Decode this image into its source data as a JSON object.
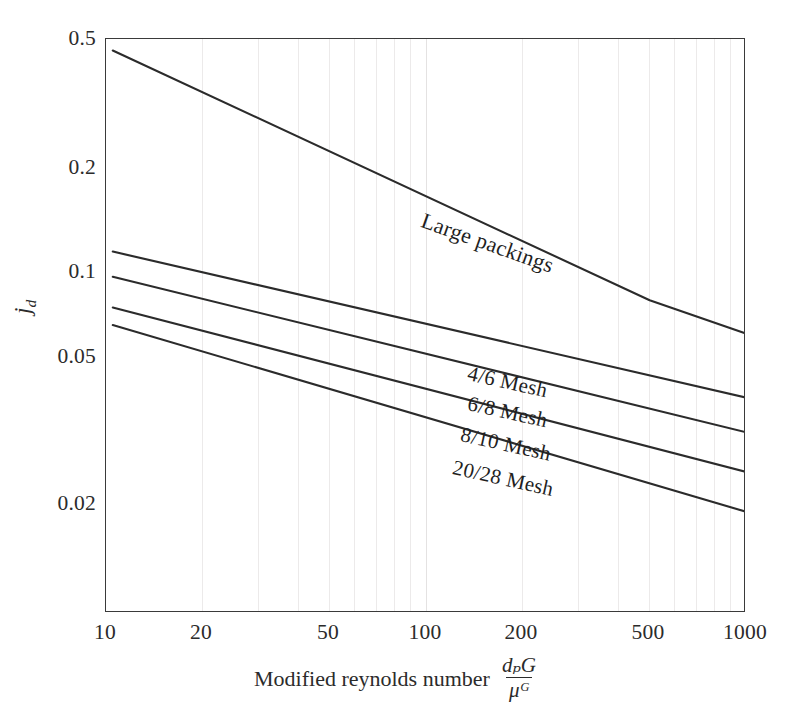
{
  "chart_data": {
    "type": "line",
    "title": "",
    "xlabel": "Modified reynolds number d_p G / μ_G",
    "xlabel_text": "Modified reynolds number",
    "xlabel_fraction": {
      "numerator": "dₚG",
      "denominator": "μᴳ"
    },
    "ylabel": "j_d",
    "ylabel_base": "j",
    "ylabel_sub": "d",
    "xscale": "log",
    "yscale": "log",
    "xlim": [
      10,
      1000
    ],
    "ylim": [
      0.015,
      0.5
    ],
    "xticks": [
      10,
      20,
      50,
      100,
      200,
      500,
      1000
    ],
    "xtick_labels": [
      "10",
      "20",
      "50",
      "100",
      "200",
      "500",
      "1000"
    ],
    "yticks": [
      0.5,
      0.2,
      0.1,
      0.05,
      0.02
    ],
    "ytick_labels": [
      "0.5",
      "0.2",
      "0.1",
      "0.05",
      "0.02"
    ],
    "grid": "vertical-minor-only",
    "legend": "inline-curve-labels",
    "series": [
      {
        "name": "Large packings",
        "label": "Large packings",
        "points": [
          [
            10.5,
            0.462
          ],
          [
            500,
            0.083
          ],
          [
            1000,
            0.066
          ]
        ]
      },
      {
        "name": "4/6 Mesh",
        "label": "4/6 Mesh",
        "points": [
          [
            10.5,
            0.116
          ],
          [
            1000,
            0.0425
          ]
        ]
      },
      {
        "name": "6/8 Mesh",
        "label": "6/8 Mesh",
        "points": [
          [
            10.5,
            0.0975
          ],
          [
            1000,
            0.0335
          ]
        ]
      },
      {
        "name": "8/10 Mesh",
        "label": "8/10 Mesh",
        "points": [
          [
            10.5,
            0.079
          ],
          [
            1000,
            0.0255
          ]
        ]
      },
      {
        "name": "20/28 Mesh",
        "label": "20/28 Mesh",
        "points": [
          [
            10.5,
            0.07
          ],
          [
            1000,
            0.0194
          ]
        ]
      }
    ],
    "colors": {
      "curve": "#2b2b2b",
      "frame": "#3a3a3a",
      "grid": "#ebe9e9",
      "text": "#2b2b2b",
      "background": "#ffffff"
    }
  }
}
